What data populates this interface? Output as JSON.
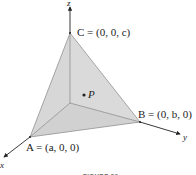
{
  "figure": {
    "axes": {
      "x": "x",
      "y": "y",
      "z": "z"
    },
    "points": {
      "A": "A = (a, 0, 0)",
      "B": "B = (0, b, 0)",
      "C": "C = (0, 0, c)",
      "P": "P"
    },
    "caption": "FIGURE 20",
    "colors": {
      "face": "#d6d6d6",
      "face_dark": "#c4c4c4",
      "line": "#333333"
    }
  }
}
